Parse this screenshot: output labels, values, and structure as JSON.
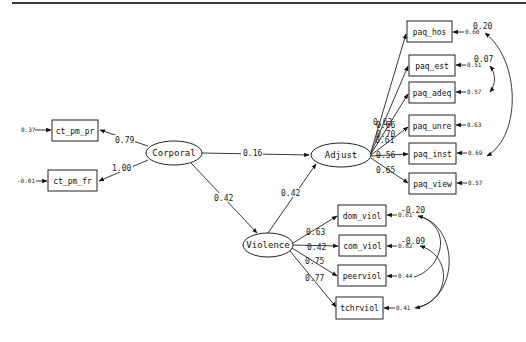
{
  "diagram": {
    "type": "structural-equation-model path diagram",
    "latents": [
      {
        "id": "corporal",
        "label": "Corporal"
      },
      {
        "id": "adjust",
        "label": "Adjust"
      },
      {
        "id": "violence",
        "label": "Violence"
      }
    ],
    "observed": [
      {
        "id": "ct_pm_pr",
        "label": "ct_pm_pr",
        "error": "0.37"
      },
      {
        "id": "ct_pm_fr",
        "label": "ct_pm_fr",
        "error": "-0.01"
      },
      {
        "id": "paq_hos",
        "label": "paq_hos",
        "error": "0.60"
      },
      {
        "id": "paq_est",
        "label": "paq_est",
        "error": "0.51"
      },
      {
        "id": "paq_adeq",
        "label": "paq_adeq",
        "error": "0.57"
      },
      {
        "id": "paq_unre",
        "label": "paq_unre",
        "error": "0.63"
      },
      {
        "id": "paq_inst",
        "label": "paq_inst",
        "error": "0.69"
      },
      {
        "id": "paq_view",
        "label": "paq_view",
        "error": "0.57"
      },
      {
        "id": "dom_viol",
        "label": "dom_viol",
        "error": "0.61"
      },
      {
        "id": "com_viol",
        "label": "com_viol",
        "error": "0.82"
      },
      {
        "id": "peerviol",
        "label": "peerviol",
        "error": "0.44"
      },
      {
        "id": "tchrviol",
        "label": "tchrviol",
        "error": "0.41"
      }
    ],
    "loadings": {
      "corporal_ct_pm_pr": "0.79",
      "corporal_ct_pm_fr": "1.00",
      "adjust_paq_hos": "0.63",
      "adjust_paq_est": "0.70",
      "adjust_paq_adeq": "0.66",
      "adjust_paq_unre": "0.61",
      "adjust_paq_inst": "0.56",
      "adjust_paq_view": "0.65",
      "violence_dom_viol": "0.63",
      "violence_com_viol": "0.42",
      "violence_peerviol": "0.75",
      "violence_tchrviol": "0.77"
    },
    "paths": {
      "corporal_adjust": "0.16",
      "corporal_violence": "0.42",
      "violence_adjust": "0.42"
    },
    "covariances": {
      "paq_hos_paq_inst": "0.20",
      "paq_est_paq_adeq": "0.07",
      "dom_viol_tchrviol": "-0.20",
      "com_viol_peerviol": "-0.09"
    }
  }
}
